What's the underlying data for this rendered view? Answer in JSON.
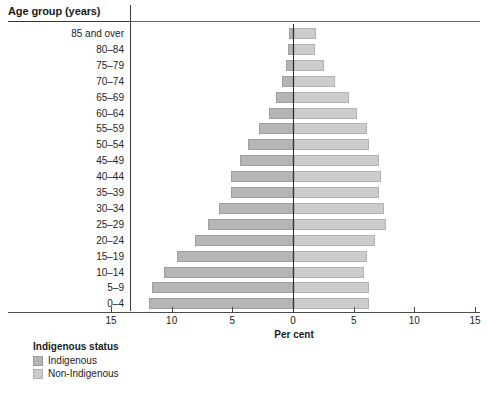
{
  "axis_title": "Age group (years)",
  "xaxis_title": "Per cent",
  "legend": {
    "title": "Indigenous status",
    "items": [
      {
        "label": "Indigenous",
        "color": "#b5b5b5"
      },
      {
        "label": "Non-Indigenous",
        "color": "#cccccc"
      }
    ]
  },
  "xticks": [
    {
      "label": "15",
      "value": -15
    },
    {
      "label": "10",
      "value": -10
    },
    {
      "label": "5",
      "value": -5
    },
    {
      "label": "0",
      "value": 0
    },
    {
      "label": "5",
      "value": 5
    },
    {
      "label": "10",
      "value": 10
    },
    {
      "label": "15",
      "value": 15
    }
  ],
  "chart_data": {
    "type": "bar",
    "subtype": "population-pyramid",
    "title": "",
    "xlabel": "Per cent",
    "ylabel": "Age group (years)",
    "xlim": [
      -15,
      15
    ],
    "grid": false,
    "legend_position": "bottom-left",
    "categories": [
      "85 and over",
      "80–84",
      "75–79",
      "70–74",
      "65–69",
      "60–64",
      "55–59",
      "50–54",
      "45–49",
      "40–44",
      "35–39",
      "30–34",
      "25–29",
      "20–24",
      "15–19",
      "10–14",
      "5–9",
      "0–4"
    ],
    "series": [
      {
        "name": "Indigenous",
        "color": "#b5b5b5",
        "direction": "left",
        "values": [
          0.3,
          0.4,
          0.6,
          0.9,
          1.4,
          2.0,
          2.8,
          3.7,
          4.4,
          5.1,
          5.1,
          6.1,
          7.0,
          8.1,
          9.6,
          10.6,
          11.6,
          11.9
        ]
      },
      {
        "name": "Non-Indigenous",
        "color": "#cccccc",
        "direction": "right",
        "values": [
          1.8,
          1.7,
          2.5,
          3.4,
          4.5,
          5.2,
          6.0,
          6.2,
          7.0,
          7.2,
          7.0,
          7.4,
          7.6,
          6.7,
          6.0,
          5.8,
          6.2,
          6.2
        ]
      }
    ]
  }
}
